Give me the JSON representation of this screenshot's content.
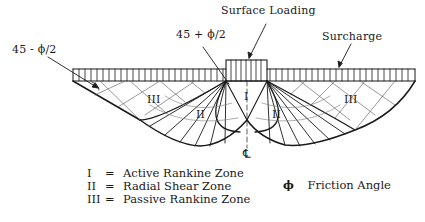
{
  "labels": {
    "surface_loading": "Surface Loading",
    "surcharge": "Surcharge",
    "angle_left": "45 -  ϕ/2",
    "angle_center": "45 + ϕ/2",
    "centerline": "℄"
  },
  "zones": {
    "left_passive": "III",
    "left_radial": "II",
    "active": "I",
    "right_radial": "II",
    "right_passive": "III"
  },
  "legend": [
    {
      "symbol": "I",
      "eq": "=",
      "text": "Active Rankine Zone"
    },
    {
      "symbol": "II",
      "eq": "=",
      "text": "Radial Shear Zone"
    },
    {
      "symbol": "III",
      "eq": "=",
      "text": "Passive Rankine Zone"
    }
  ],
  "phi_legend": {
    "symbol": "ϕ",
    "text": "Friction Angle"
  },
  "colors": {
    "line": "#1a1a1a",
    "grid": "#555555",
    "background": "#ffffff"
  }
}
